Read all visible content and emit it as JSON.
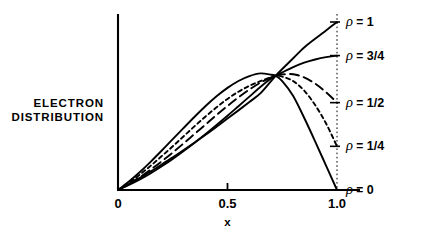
{
  "chart_data": {
    "type": "line",
    "title": "",
    "xlabel": "x",
    "ylabel": "ELECTRON DISTRIBUTION",
    "ylabel_lines": [
      "ELECTRON",
      "DISTRIBUTION"
    ],
    "xlim": [
      0,
      1.05
    ],
    "ylim": [
      0,
      1.05
    ],
    "grid": false,
    "legend_position": "right-inline",
    "x_ticks": [
      {
        "value": 0,
        "label": "0"
      },
      {
        "value": 0.5,
        "label": "0.5"
      },
      {
        "value": 1.0,
        "label": "1.0"
      }
    ],
    "y_ticks": [],
    "annotations": [
      {
        "name": "crossing-point",
        "x": 0.72,
        "y": 0.68,
        "label": ""
      }
    ],
    "reference_lines": [
      {
        "name": "x-equals-one",
        "orientation": "vertical",
        "x": 1.0,
        "style": "dotted"
      }
    ],
    "series": [
      {
        "name": "rho-1",
        "label_rho": "ρ",
        "label_eq": "=",
        "label_value": "1",
        "style": "solid",
        "end_value": 1.0,
        "x": [
          0,
          0.05,
          0.1,
          0.15,
          0.2,
          0.25,
          0.3,
          0.35,
          0.4,
          0.45,
          0.5,
          0.55,
          0.6,
          0.65,
          0.7,
          0.72,
          0.75,
          0.8,
          0.85,
          0.9,
          0.95,
          1.0
        ],
        "values": [
          0,
          0.035,
          0.072,
          0.111,
          0.152,
          0.194,
          0.238,
          0.283,
          0.329,
          0.377,
          0.425,
          0.474,
          0.524,
          0.575,
          0.65,
          0.68,
          0.72,
          0.784,
          0.848,
          0.9,
          0.95,
          1.0
        ]
      },
      {
        "name": "rho-3-4",
        "label_rho": "ρ",
        "label_eq": "=",
        "label_value": "3/4",
        "style": "solid",
        "end_value": 0.8,
        "x": [
          0,
          0.05,
          0.1,
          0.15,
          0.2,
          0.25,
          0.3,
          0.35,
          0.4,
          0.45,
          0.5,
          0.55,
          0.6,
          0.65,
          0.7,
          0.72,
          0.75,
          0.8,
          0.85,
          0.9,
          0.95,
          1.0
        ],
        "values": [
          0,
          0.03,
          0.063,
          0.1,
          0.141,
          0.185,
          0.232,
          0.281,
          0.333,
          0.387,
          0.442,
          0.499,
          0.556,
          0.613,
          0.665,
          0.68,
          0.7,
          0.732,
          0.758,
          0.777,
          0.791,
          0.8
        ]
      },
      {
        "name": "rho-1-2",
        "label_rho": "ρ",
        "label_eq": "=",
        "label_value": "1/2",
        "style": "dashed-long",
        "end_value": 0.52,
        "x": [
          0,
          0.05,
          0.1,
          0.15,
          0.2,
          0.25,
          0.3,
          0.35,
          0.4,
          0.45,
          0.5,
          0.55,
          0.6,
          0.65,
          0.7,
          0.72,
          0.75,
          0.8,
          0.85,
          0.9,
          0.95,
          1.0
        ],
        "values": [
          0,
          0.036,
          0.077,
          0.122,
          0.171,
          0.223,
          0.278,
          0.334,
          0.39,
          0.446,
          0.5,
          0.551,
          0.598,
          0.639,
          0.671,
          0.68,
          0.688,
          0.689,
          0.67,
          0.633,
          0.582,
          0.52
        ]
      },
      {
        "name": "rho-1-4",
        "label_rho": "ρ",
        "label_eq": "=",
        "label_value": "1/4",
        "style": "dashed-short",
        "end_value": 0.26,
        "x": [
          0,
          0.05,
          0.1,
          0.15,
          0.2,
          0.25,
          0.3,
          0.35,
          0.4,
          0.45,
          0.5,
          0.55,
          0.6,
          0.65,
          0.7,
          0.72,
          0.75,
          0.8,
          0.85,
          0.9,
          0.95,
          1.0
        ],
        "values": [
          0,
          0.043,
          0.092,
          0.145,
          0.202,
          0.26,
          0.32,
          0.38,
          0.438,
          0.492,
          0.542,
          0.585,
          0.62,
          0.648,
          0.672,
          0.68,
          0.675,
          0.648,
          0.592,
          0.506,
          0.396,
          0.26
        ]
      },
      {
        "name": "rho-0",
        "label_rho": "ρ",
        "label_eq": "=",
        "label_value": "0",
        "style": "solid",
        "end_value": 0.0,
        "x": [
          0,
          0.05,
          0.1,
          0.15,
          0.2,
          0.25,
          0.3,
          0.35,
          0.4,
          0.45,
          0.5,
          0.55,
          0.6,
          0.65,
          0.7,
          0.72,
          0.75,
          0.8,
          0.85,
          0.9,
          0.95,
          1.0
        ],
        "values": [
          0,
          0.05,
          0.107,
          0.169,
          0.235,
          0.303,
          0.37,
          0.436,
          0.5,
          0.558,
          0.608,
          0.649,
          0.678,
          0.694,
          0.686,
          0.68,
          0.648,
          0.56,
          0.43,
          0.29,
          0.145,
          0.0
        ]
      }
    ]
  }
}
